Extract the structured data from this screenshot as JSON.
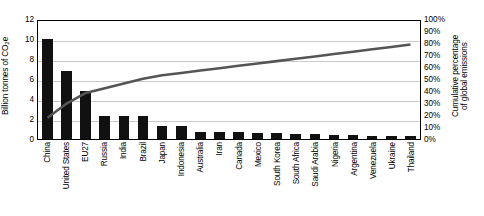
{
  "chart_data": {
    "type": "bar",
    "title": "",
    "subtitle": "",
    "xlabel": "",
    "ylabel": "Billion tonnes of CO2e",
    "ylabel_display_prefix": "Billion tonnes of CO",
    "ylabel_display_sub": "2",
    "ylabel_display_suffix": "e",
    "y2label_line1": "Cumulative percentage",
    "y2label_line2": "of global emissions",
    "ylim": [
      0,
      12
    ],
    "y2lim": [
      0,
      100
    ],
    "yticks": [
      "12",
      "10",
      "8",
      "6",
      "4",
      "2",
      "0"
    ],
    "ytick_values": [
      12,
      10,
      8,
      6,
      4,
      2,
      0
    ],
    "y2ticks": [
      "100%",
      "90%",
      "80%",
      "70%",
      "60%",
      "50%",
      "40%",
      "30%",
      "20%",
      "10%",
      "0%"
    ],
    "y2tick_values": [
      100,
      90,
      80,
      70,
      60,
      50,
      40,
      30,
      20,
      10,
      0
    ],
    "grid": true,
    "legend": "none",
    "bar_color": "#111111",
    "line_color": "#555555",
    "categories": [
      "China",
      "United States",
      "EU27",
      "Russia",
      "India",
      "Brazil",
      "Japan",
      "Indonesia",
      "Australia",
      "Iran",
      "Canada",
      "Mexico",
      "South Korea",
      "South Africa",
      "Saudi Arabia",
      "Nigeria",
      "Argentina",
      "Venezuela",
      "Ukraine",
      "Thailand"
    ],
    "series": [
      {
        "name": "Emissions",
        "unit": "Billion tonnes of CO2e",
        "axis": "left",
        "kind": "bar",
        "values": [
          10.0,
          6.8,
          4.8,
          2.3,
          2.3,
          2.3,
          1.3,
          1.3,
          0.75,
          0.75,
          0.7,
          0.65,
          0.6,
          0.55,
          0.5,
          0.45,
          0.4,
          0.35,
          0.35,
          0.3
        ]
      },
      {
        "name": "Cumulative percentage of global emissions",
        "unit": "%",
        "axis": "right",
        "kind": "line",
        "values": [
          18,
          30,
          39,
          43,
          47,
          51,
          54,
          56,
          58,
          60,
          62,
          64,
          66,
          68,
          70,
          72,
          74,
          76,
          78,
          80
        ]
      }
    ]
  }
}
